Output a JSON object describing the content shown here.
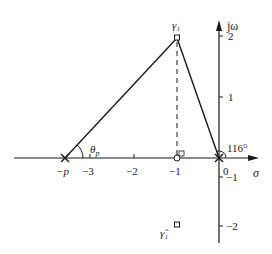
{
  "diagram": {
    "type": "s-plane root locus geometry",
    "axes": {
      "real_label": "σ",
      "imag_label": "jω",
      "real_ticks": [
        {
          "label": "−3",
          "value": -3
        },
        {
          "label": "−2",
          "value": -2
        },
        {
          "label": "−1",
          "value": -1
        },
        {
          "label": "0",
          "value": 0
        }
      ],
      "imag_ticks": [
        {
          "label": "2",
          "value": 2
        },
        {
          "label": "1",
          "value": 1
        },
        {
          "label": "−1",
          "value": -1
        },
        {
          "label": "−2",
          "value": -2
        }
      ]
    },
    "points": {
      "pole_p": {
        "label": "−p",
        "marker": "cross"
      },
      "pole_origin": {
        "label": "",
        "marker": "cross"
      },
      "zero": {
        "label": "",
        "marker": "circle",
        "value": -1
      },
      "gamma1": {
        "label": "γ₁",
        "marker": "square",
        "re": -1,
        "im": 2
      },
      "gamma1_conj": {
        "label": "γ̂₁",
        "marker": "square",
        "re": -1,
        "im": -2
      }
    },
    "angles": {
      "theta_p": {
        "label": "θp",
        "symbol": "θ",
        "subscript": "p"
      },
      "origin_angle": {
        "label": "116°"
      }
    },
    "colors": {
      "line": "#1a1a1a",
      "text": "#222222",
      "background": "#ffffff"
    }
  }
}
